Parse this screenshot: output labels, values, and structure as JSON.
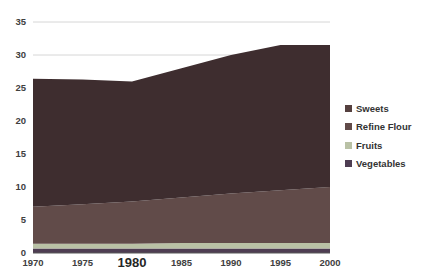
{
  "chart_data": {
    "type": "area",
    "stacked": true,
    "title": "",
    "x": [
      1970,
      1975,
      1980,
      1985,
      1990,
      1995,
      2000
    ],
    "x_tick_labels": [
      "1970",
      "1975",
      "1980",
      "1985",
      "1990",
      "1995",
      "2000"
    ],
    "emphasized_x_tick": "1980",
    "y_ticks": [
      0,
      5,
      10,
      15,
      20,
      25,
      30,
      35
    ],
    "ylim": [
      0,
      35
    ],
    "grid": true,
    "axis_color": "#595959",
    "gridline_color": "#d6d6d6",
    "legend_position": "right",
    "series": [
      {
        "name": "Vegetables",
        "color": "#4e3d52",
        "values": [
          0.7,
          0.7,
          0.7,
          0.7,
          0.7,
          0.7,
          0.7
        ]
      },
      {
        "name": "Fruits",
        "color": "#b9c1a5",
        "values": [
          0.7,
          0.7,
          0.7,
          0.8,
          0.8,
          0.8,
          0.8
        ]
      },
      {
        "name": "Refine Flour",
        "color": "#614b49",
        "values": [
          5.6,
          6.0,
          6.4,
          6.9,
          7.5,
          8.0,
          8.5
        ]
      },
      {
        "name": "Sweets",
        "color": "#3e2d2f",
        "values": [
          19.4,
          18.9,
          18.2,
          19.6,
          21.0,
          22.0,
          21.5
        ]
      }
    ],
    "legend": [
      {
        "label": "Sweets",
        "color": "#55403f"
      },
      {
        "label": "Refine Flour",
        "color": "#614b49"
      },
      {
        "label": "Fruits",
        "color": "#b9c1a5"
      },
      {
        "label": "Vegetables",
        "color": "#4e3d52"
      }
    ]
  }
}
